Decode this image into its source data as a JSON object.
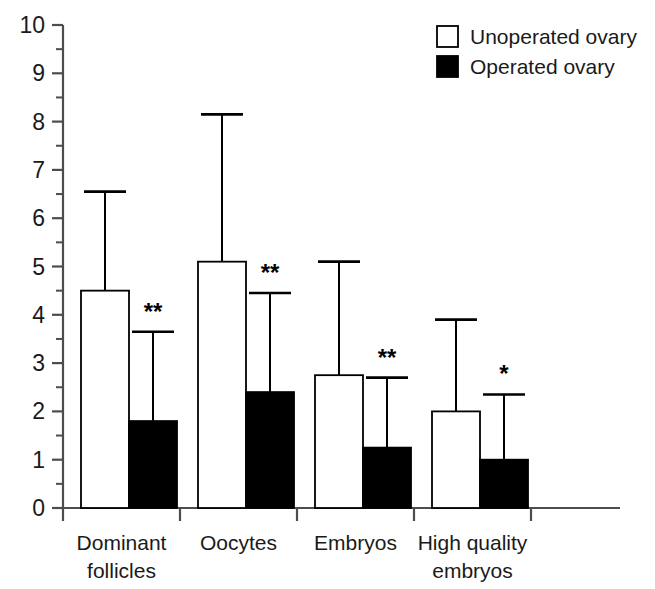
{
  "chart_data": {
    "type": "bar",
    "title": "",
    "subtitle": "",
    "xlabel": "",
    "ylabel": "",
    "ylim": [
      0,
      10
    ],
    "y_ticks": [
      0,
      1,
      2,
      3,
      4,
      5,
      6,
      7,
      8,
      9,
      10
    ],
    "y_minor_tick_step": 0.5,
    "grid": false,
    "legend_position": "top-right",
    "categories": [
      "Dominant follicles",
      "Oocytes",
      "Embryos",
      "High quality embryos"
    ],
    "category_lines": [
      [
        "Dominant",
        "follicles"
      ],
      [
        "Oocytes"
      ],
      [
        "Embryos"
      ],
      [
        "High quality",
        "embryos"
      ]
    ],
    "series": [
      {
        "name": "Unoperated ovary",
        "color": "#ffffff",
        "edge_color": "#000000",
        "values": [
          4.5,
          5.1,
          2.75,
          2.0
        ],
        "error_upper": [
          6.55,
          8.15,
          5.1,
          3.9
        ],
        "significance": [
          "",
          "",
          "",
          ""
        ]
      },
      {
        "name": "Operated ovary",
        "color": "#000000",
        "edge_color": "#000000",
        "values": [
          1.8,
          2.4,
          1.25,
          1.0
        ],
        "error_upper": [
          3.65,
          4.45,
          2.7,
          2.35
        ],
        "significance": [
          "**",
          "**",
          "**",
          "*"
        ]
      }
    ]
  },
  "legend": {
    "items": [
      {
        "label": "Unoperated ovary",
        "swatch": "open-square",
        "color": "#ffffff"
      },
      {
        "label": "Operated ovary",
        "swatch": "filled-square",
        "color": "#000000"
      }
    ]
  },
  "axis": {
    "y_tick_labels": [
      "10",
      "9",
      "8",
      "7",
      "6",
      "5",
      "4",
      "3",
      "2",
      "1",
      "0"
    ]
  },
  "colors": {
    "axis": "#4d4d4d",
    "bar_edge": "#1a1a1a",
    "unoperated_fill": "#ffffff",
    "operated_fill": "#000000",
    "text": "#1a1a1a"
  }
}
